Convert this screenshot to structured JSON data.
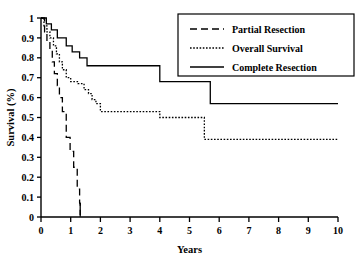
{
  "chart_data": {
    "type": "line",
    "title": "",
    "xlabel": "Years",
    "ylabel": "Survival (%)",
    "xlim": [
      0,
      10
    ],
    "ylim": [
      0,
      1
    ],
    "xticks": [
      "0",
      "1",
      "2",
      "3",
      "4",
      "5",
      "6",
      "7",
      "8",
      "9",
      "10"
    ],
    "yticks": [
      "0",
      "0.1",
      "0.2",
      "0.3",
      "0.4",
      "0.5",
      "0.6",
      "0.7",
      "0.8",
      "0.9",
      "1"
    ],
    "grid": false,
    "legend_position": "top-right",
    "series": [
      {
        "name": "Partial Resection",
        "style": "dashed",
        "color": "#000000",
        "points": [
          [
            0.0,
            1.0
          ],
          [
            0.12,
            0.93
          ],
          [
            0.2,
            0.88
          ],
          [
            0.3,
            0.84
          ],
          [
            0.38,
            0.78
          ],
          [
            0.45,
            0.72
          ],
          [
            0.55,
            0.66
          ],
          [
            0.62,
            0.6
          ],
          [
            0.72,
            0.53
          ],
          [
            0.85,
            0.4
          ],
          [
            0.98,
            0.33
          ],
          [
            1.1,
            0.25
          ],
          [
            1.22,
            0.14
          ],
          [
            1.3,
            0.07
          ],
          [
            1.32,
            0.0
          ]
        ]
      },
      {
        "name": "Overall Survival",
        "style": "dotted",
        "color": "#000000",
        "points": [
          [
            0.0,
            1.0
          ],
          [
            0.1,
            0.96
          ],
          [
            0.2,
            0.93
          ],
          [
            0.3,
            0.9
          ],
          [
            0.42,
            0.86
          ],
          [
            0.52,
            0.82
          ],
          [
            0.62,
            0.78
          ],
          [
            0.72,
            0.74
          ],
          [
            0.85,
            0.7
          ],
          [
            1.0,
            0.68
          ],
          [
            1.25,
            0.67
          ],
          [
            1.45,
            0.64
          ],
          [
            1.6,
            0.62
          ],
          [
            1.72,
            0.59
          ],
          [
            1.85,
            0.57
          ],
          [
            2.0,
            0.53
          ],
          [
            4.0,
            0.5
          ],
          [
            5.5,
            0.39
          ],
          [
            10.0,
            0.39
          ]
        ]
      },
      {
        "name": "Complete Resection",
        "style": "solid",
        "color": "#000000",
        "points": [
          [
            0.0,
            1.0
          ],
          [
            0.18,
            0.97
          ],
          [
            0.35,
            0.94
          ],
          [
            0.55,
            0.9
          ],
          [
            0.85,
            0.86
          ],
          [
            1.05,
            0.83
          ],
          [
            1.3,
            0.8
          ],
          [
            1.55,
            0.76
          ],
          [
            4.0,
            0.68
          ],
          [
            5.7,
            0.57
          ],
          [
            10.0,
            0.57
          ]
        ]
      }
    ],
    "censor_marks": [
      {
        "series": "Partial Resection",
        "x": 1.32,
        "y": 0.04
      }
    ]
  },
  "legend": {
    "items": [
      {
        "label": "Partial Resection",
        "style": "dashed"
      },
      {
        "label": "Overall Survival",
        "style": "dotted"
      },
      {
        "label": "Complete Resection",
        "style": "solid"
      }
    ]
  }
}
